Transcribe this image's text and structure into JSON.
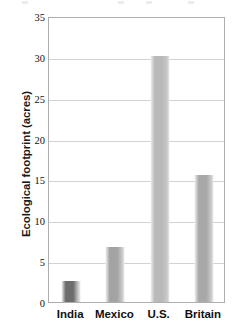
{
  "chart_data": {
    "type": "bar",
    "title": "",
    "xlabel": "",
    "ylabel": "Ecological footprint (acres)",
    "categories": [
      "India",
      "Mexico",
      "U.S.",
      "Britain"
    ],
    "values": [
      2.6,
      6.7,
      30.1,
      15.6
    ],
    "ylim": [
      0,
      35
    ],
    "ytick_labels": [
      "0",
      "5",
      "10",
      "15",
      "20",
      "25",
      "30",
      "35"
    ],
    "ytick_values": [
      0,
      5,
      10,
      15,
      20,
      25,
      30,
      35
    ],
    "grid": "horizontal",
    "legend": "none",
    "bar_colors": [
      "#6d6d6d",
      "#a3a3a3",
      "#b9b9b9",
      "#a8a8a8"
    ],
    "axis_color": "#aeaeae",
    "gridline_color": "#d2d2d2",
    "text_color": "#111111",
    "background_color": "#ffffff"
  }
}
